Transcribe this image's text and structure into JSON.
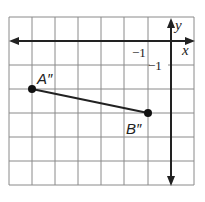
{
  "diagram": {
    "type": "coordinate-grid",
    "grid": {
      "columns": 8,
      "rows": 7,
      "x_range": [
        -7,
        1
      ],
      "y_range": [
        -6,
        1
      ],
      "line_color": "#888888",
      "axis_color": "#222222"
    },
    "axes": {
      "x_label": "x",
      "y_label": "y",
      "x_tick_label": "−1",
      "y_tick_label": "−1"
    },
    "points": [
      {
        "label": "A″",
        "x": -6,
        "y": -2
      },
      {
        "label": "B″",
        "x": -1,
        "y": -3
      }
    ],
    "segment": {
      "from": "A″",
      "to": "B″"
    }
  }
}
